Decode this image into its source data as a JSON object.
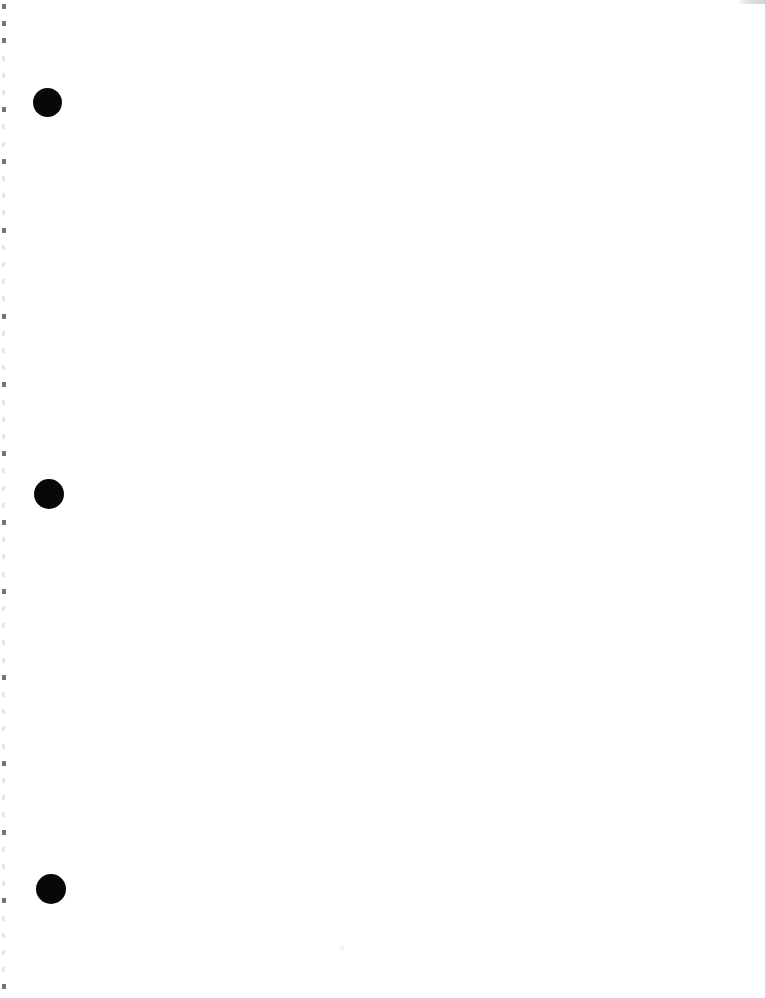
{
  "page": {
    "kind": "scanned-document-page",
    "width": 765,
    "height": 998,
    "background_color": "#ffffff",
    "body_text": "",
    "note": "blank page with bullet markers"
  },
  "markers": {
    "label": "Bullet markers",
    "color": "#080808",
    "count": 3,
    "items": [
      {
        "name": "bullet-marker-1",
        "left": 33,
        "top": 88,
        "size": 29,
        "text": ""
      },
      {
        "name": "bullet-marker-2",
        "left": 34,
        "top": 479,
        "size": 30,
        "text": ""
      },
      {
        "name": "bullet-marker-3",
        "left": 36,
        "top": 874,
        "size": 30,
        "text": ""
      }
    ]
  },
  "scan_edge": {
    "label": "Scan edge dashes",
    "color": "#c9c9c9",
    "strong_color": "#6e6e6e",
    "start_y": 4,
    "spacing": 17.2,
    "count": 58,
    "strong_indices": [
      0,
      1,
      2,
      6,
      9,
      13,
      18,
      22,
      26,
      30,
      34,
      39,
      44,
      48,
      52,
      57
    ],
    "faint_indices": [
      3,
      4,
      5,
      7,
      8,
      10,
      11,
      12,
      14,
      15,
      16,
      17,
      19,
      20,
      21,
      23,
      24,
      25,
      27,
      28,
      29,
      31,
      32,
      33,
      35,
      36,
      37,
      38,
      40,
      41,
      42,
      43,
      45,
      46,
      47,
      49,
      50,
      51,
      53,
      54,
      55,
      56
    ]
  },
  "artifacts": {
    "top_right_band": {
      "label": "Top right scan band",
      "color": "#d2d2d2",
      "left": 739,
      "top": 0,
      "width": 26,
      "height": 4
    },
    "speck": {
      "label": "Page speck",
      "color": "#f4f4f4",
      "left": 340,
      "top": 946
    }
  }
}
